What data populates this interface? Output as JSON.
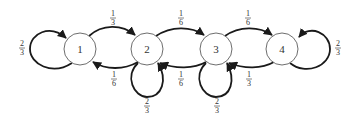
{
  "diagram": {
    "type": "markov-chain",
    "nodes": [
      {
        "id": "1",
        "label": "1"
      },
      {
        "id": "2",
        "label": "2"
      },
      {
        "id": "3",
        "label": "3"
      },
      {
        "id": "4",
        "label": "4"
      }
    ],
    "edges": [
      {
        "from": "1",
        "to": "1",
        "num": "2",
        "den": "3"
      },
      {
        "from": "1",
        "to": "2",
        "num": "1",
        "den": "3"
      },
      {
        "from": "2",
        "to": "1",
        "num": "1",
        "den": "6"
      },
      {
        "from": "2",
        "to": "2",
        "num": "2",
        "den": "3"
      },
      {
        "from": "2",
        "to": "3",
        "num": "1",
        "den": "6"
      },
      {
        "from": "3",
        "to": "2",
        "num": "1",
        "den": "6"
      },
      {
        "from": "3",
        "to": "3",
        "num": "2",
        "den": "3"
      },
      {
        "from": "3",
        "to": "4",
        "num": "1",
        "den": "6"
      },
      {
        "from": "4",
        "to": "3",
        "num": "1",
        "den": "3"
      },
      {
        "from": "4",
        "to": "4",
        "num": "2",
        "den": "3"
      }
    ],
    "colors": {
      "edge": "#1a1a1a",
      "node_stroke": "#6e6e6e",
      "text": "#333333"
    }
  }
}
